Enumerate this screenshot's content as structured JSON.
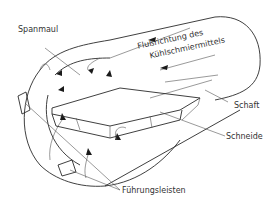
{
  "diagram": {
    "type": "technical-illustration",
    "labels": {
      "spanmaul": "Spanmaul",
      "flow_line1": "Flußrichtung des",
      "flow_line2": "Kühlschmiermittels",
      "schaft": "Schaft",
      "schneide": "Schneide",
      "fuehrungsleisten": "Führungsleisten"
    },
    "colors": {
      "line": "#2a2a2a",
      "text": "#333333",
      "background": "#ffffff"
    }
  }
}
